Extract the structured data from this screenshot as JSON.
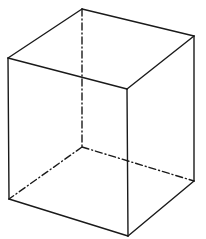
{
  "diagram": {
    "stroke_color": "#1a1a1a",
    "background": "#ffffff",
    "vertices": {
      "A_top_left": [
        8,
        58
      ],
      "B_top_back": [
        82,
        9
      ],
      "C_top_right": [
        194,
        36
      ],
      "D_top_front": [
        127,
        89
      ],
      "E_bottom_left": [
        9,
        199
      ],
      "F_bottom_back_hidden": [
        82,
        147
      ],
      "G_bottom_right": [
        194,
        181
      ],
      "H_bottom_front": [
        128,
        236
      ]
    },
    "visible_edges": [
      [
        "A_top_left",
        "B_top_back"
      ],
      [
        "B_top_back",
        "C_top_right"
      ],
      [
        "C_top_right",
        "D_top_front"
      ],
      [
        "D_top_front",
        "A_top_left"
      ],
      [
        "A_top_left",
        "E_bottom_left"
      ],
      [
        "D_top_front",
        "H_bottom_front"
      ],
      [
        "C_top_right",
        "G_bottom_right"
      ],
      [
        "E_bottom_left",
        "H_bottom_front"
      ],
      [
        "H_bottom_front",
        "G_bottom_right"
      ]
    ],
    "hidden_edges": [
      [
        "B_top_back",
        "F_bottom_back_hidden"
      ],
      [
        "F_bottom_back_hidden",
        "E_bottom_left"
      ],
      [
        "F_bottom_back_hidden",
        "G_bottom_right"
      ]
    ]
  }
}
